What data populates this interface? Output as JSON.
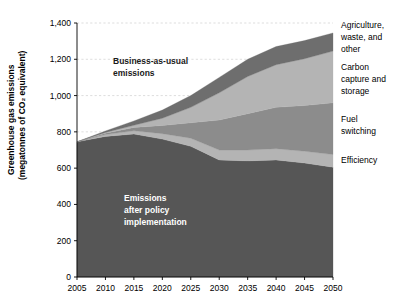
{
  "chart_data": {
    "type": "area",
    "stacked": true,
    "title": "",
    "xlabel": "",
    "ylabel": "Greenhouse gas emissions (megatonnes of CO₂ equivalent)",
    "ylabel_line1": "Greenhouse gas emissions",
    "ylabel_line2": "(megatonnes of CO₂ equivalent)",
    "x": [
      2005,
      2010,
      2015,
      2020,
      2025,
      2030,
      2035,
      2040,
      2045,
      2050
    ],
    "categories": [
      "2005",
      "2010",
      "2015",
      "2020",
      "2025",
      "2030",
      "2035",
      "2040",
      "2045",
      "2050"
    ],
    "xlim": [
      2005,
      2050
    ],
    "ylim": [
      0,
      1400
    ],
    "yticks": [
      0,
      200,
      400,
      600,
      800,
      1000,
      1200,
      1400
    ],
    "ytick_labels": [
      "0",
      "200",
      "400",
      "600",
      "800",
      "1,000",
      "1,200",
      "1,400"
    ],
    "grid": true,
    "grid_axis": "y",
    "legend_position": "right",
    "series": [
      {
        "name": "Emissions after policy implementation",
        "key": "policy",
        "color": "#565656",
        "values": [
          745,
          775,
          788,
          760,
          720,
          645,
          640,
          645,
          628,
          605
        ]
      },
      {
        "name": "Efficiency",
        "key": "efficiency",
        "color": "#b4b4b4",
        "values": [
          0,
          10,
          18,
          30,
          45,
          55,
          60,
          62,
          65,
          70
        ]
      },
      {
        "name": "Fuel switching",
        "key": "fuel_switching",
        "color": "#8c8c8c",
        "values": [
          0,
          8,
          18,
          45,
          85,
          165,
          200,
          228,
          252,
          285
        ]
      },
      {
        "name": "Carbon capture and storage",
        "key": "ccs",
        "color": "#b4b4b4",
        "values": [
          0,
          4,
          12,
          40,
          85,
          150,
          205,
          235,
          258,
          285
        ]
      },
      {
        "name": "Agriculture, waste, and other",
        "key": "agriculture",
        "color": "#6e6e6e",
        "values": [
          0,
          8,
          24,
          45,
          65,
          85,
          95,
          100,
          100,
          100
        ]
      }
    ],
    "totals_business_as_usual": [
      745,
      805,
      860,
      920,
      1000,
      1100,
      1200,
      1270,
      1303,
      1345
    ],
    "annotations": [
      {
        "name": "business-as-usual-annotation",
        "line1": "Business-as-usual",
        "line2": "emissions",
        "style": "dark"
      },
      {
        "name": "emissions-after-policy-annotation",
        "line1": "Emissions",
        "line2": "after policy",
        "line3": "implementation",
        "style": "light"
      }
    ],
    "legend": [
      {
        "name": "agriculture-waste-other",
        "lines": [
          "Agriculture,",
          "waste, and",
          "other"
        ],
        "color": "#6e6e6e"
      },
      {
        "name": "carbon-capture-and-storage",
        "lines": [
          "Carbon",
          "capture and",
          "storage"
        ],
        "color": "#b4b4b4"
      },
      {
        "name": "fuel-switching",
        "lines": [
          "Fuel",
          "switching"
        ],
        "color": "#8c8c8c"
      },
      {
        "name": "efficiency",
        "lines": [
          "Efficiency"
        ],
        "color": "#b4b4b4"
      }
    ],
    "colors": {
      "policy": "#565656",
      "efficiency": "#b4b4b4",
      "fuel_switching": "#8c8c8c",
      "ccs": "#b4b4b4",
      "agriculture": "#6e6e6e",
      "background": "#ffffff",
      "axis": "#000000",
      "gridline": "#c8c8c8"
    }
  }
}
